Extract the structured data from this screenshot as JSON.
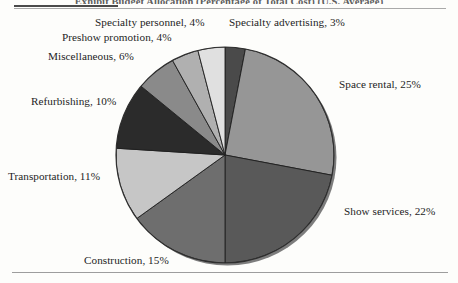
{
  "figure": {
    "caption": "Exhibit Budget Allocation (Percentage of Total Cost) (U.S. Average)",
    "background_color": "#fdfdfb",
    "rule_color": "#9d9d9d",
    "rule_accent_color": "#4a4a4a"
  },
  "chart_data": {
    "type": "pie",
    "title": "Exhibit Budget Allocation (Percentage of Total Cost) (U.S. Average)",
    "xlabel": "",
    "ylabel": "",
    "legend_position": "callout-labels",
    "grid": false,
    "start_angle_deg": 0,
    "direction": "clockwise",
    "categories": [
      "Specialty advertising",
      "Space rental",
      "Show services",
      "Construction",
      "Transportation",
      "Refurbishing",
      "Miscellaneous",
      "Preshow promotion",
      "Specialty personnel"
    ],
    "values": [
      3,
      25,
      22,
      15,
      11,
      10,
      6,
      4,
      4
    ],
    "unit": "%",
    "total": 100,
    "colors": [
      "#4a4a4a",
      "#969696",
      "#595959",
      "#6e6e6e",
      "#c6c6c6",
      "#2b2b2b",
      "#8a8a8a",
      "#b0b0b0",
      "#e0e0e0"
    ],
    "labels": [
      "Specialty advertising, 3%",
      "Space rental, 25%",
      "Show services, 22%",
      "Construction, 15%",
      "Transportation, 11%",
      "Refurbishing, 10%",
      "Miscellaneous, 6%",
      "Preshow promotion, 4%",
      "Specialty personnel, 4%"
    ]
  },
  "labels": {
    "specialty_personnel": "Specialty personnel, 4%",
    "specialty_advertising": "Specialty advertising, 3%",
    "preshow_promotion": "Preshow promotion, 4%",
    "miscellaneous": "Miscellaneous, 6%",
    "refurbishing": "Refurbishing, 10%",
    "transportation": "Transportation, 11%",
    "construction": "Construction, 15%",
    "space_rental": "Space rental, 25%",
    "show_services": "Show services, 22%"
  }
}
